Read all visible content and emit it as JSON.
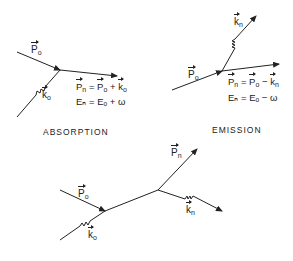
{
  "figures": {
    "absorption": {
      "caption": "ABSORPTION",
      "incoming_particle_label": {
        "base": "P",
        "sub": "o"
      },
      "photon_label": {
        "base": "k",
        "sub": "o"
      },
      "eq_momentum": {
        "lhs_base": "P",
        "lhs_sub": "n",
        "op": " = ",
        "a_base": "P",
        "a_sub": "o",
        "op2": " + ",
        "b_base": "k",
        "b_sub": "o"
      },
      "eq_energy": "Eₙ = Eₒ + ω"
    },
    "emission": {
      "caption": "EMISSION",
      "incoming_particle_label": {
        "base": "P",
        "sub": "o"
      },
      "photon_label": {
        "base": "k",
        "sub": "n"
      },
      "eq_momentum": {
        "lhs_base": "P",
        "lhs_sub": "n",
        "op": " = ",
        "a_base": "P",
        "a_sub": "o",
        "op2": " − ",
        "b_base": "k",
        "b_sub": "n"
      },
      "eq_energy": "Eₙ = Eₒ − ω"
    },
    "scattering": {
      "incoming_particle_label": {
        "base": "P",
        "sub": "o"
      },
      "incoming_photon_label": {
        "base": "k",
        "sub": "o"
      },
      "outgoing_particle_label": {
        "base": "P",
        "sub": "n"
      },
      "outgoing_photon_label": {
        "base": "k",
        "sub": "n"
      }
    }
  },
  "colors": {
    "ink": "#222222",
    "background": "#ffffff"
  }
}
